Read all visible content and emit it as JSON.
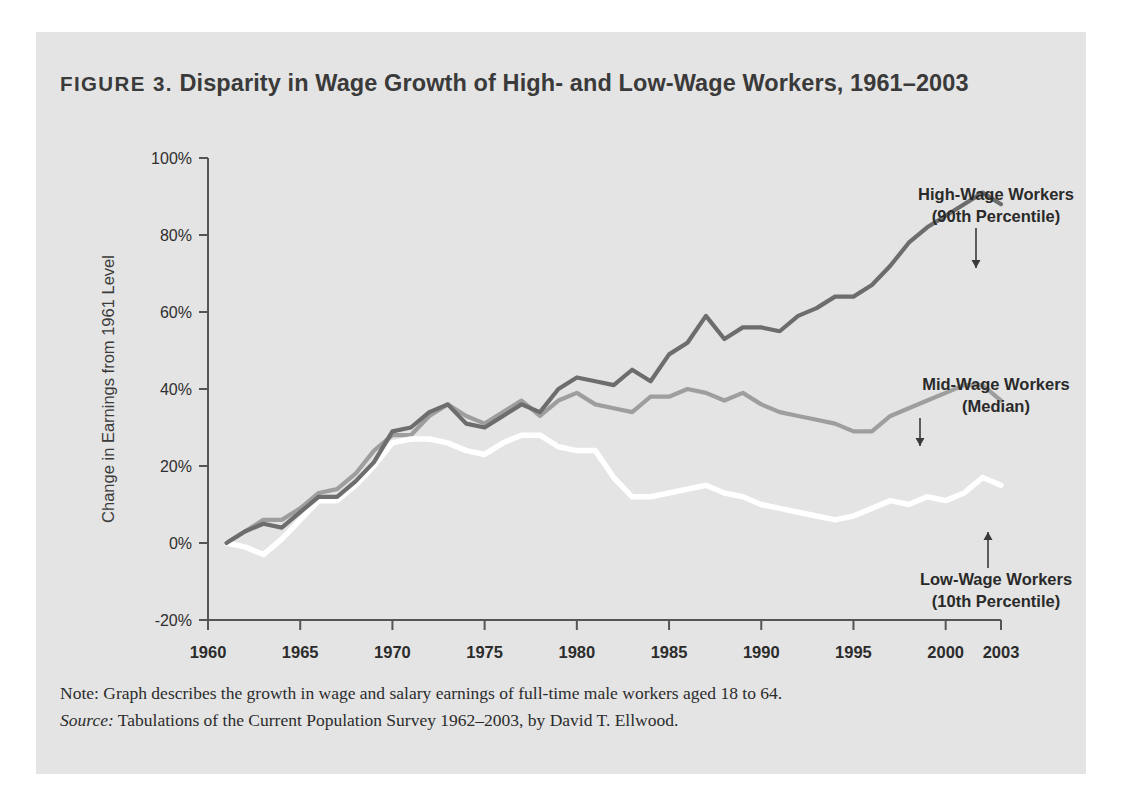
{
  "figure": {
    "label": "FIGURE 3.",
    "title": "Disparity in Wage Growth of High- and Low-Wage Workers, 1961–2003",
    "note": "Note: Graph describes the growth in wage and salary earnings of full-time male workers aged 18 to 64.",
    "source_label": "Source:",
    "source_text": " Tabulations of the Current Population Survey 1962–2003, by David T. Ellwood."
  },
  "colors": {
    "panel_background": "#e4e4e4",
    "page_background": "#ffffff",
    "axis": "#555555",
    "high_wage": "#6d6d6d",
    "mid_wage": "#9e9e9e",
    "low_wage": "#ffffff",
    "text": "#2c2c2c"
  },
  "chart_data": {
    "type": "line",
    "title": "Disparity in Wage Growth of High- and Low-Wage Workers, 1961–2003",
    "xlabel": "",
    "ylabel": "Change in Earnings from 1961 Level",
    "xlim": [
      1960,
      2003
    ],
    "ylim": [
      -20,
      100
    ],
    "ytick_labels": [
      "-20%",
      "0%",
      "20%",
      "40%",
      "60%",
      "80%",
      "100%"
    ],
    "ytick_values": [
      -20,
      0,
      20,
      40,
      60,
      80,
      100
    ],
    "xtick_labels": [
      "1960",
      "1965",
      "1970",
      "1975",
      "1980",
      "1985",
      "1990",
      "1995",
      "2000",
      "2003"
    ],
    "xtick_values": [
      1960,
      1965,
      1970,
      1975,
      1980,
      1985,
      1990,
      1995,
      2000,
      2003
    ],
    "grid": false,
    "legend_position": "inline-annotations",
    "x": [
      1961,
      1962,
      1963,
      1964,
      1965,
      1966,
      1967,
      1968,
      1969,
      1970,
      1971,
      1972,
      1973,
      1974,
      1975,
      1976,
      1977,
      1978,
      1979,
      1980,
      1981,
      1982,
      1983,
      1984,
      1985,
      1986,
      1987,
      1988,
      1989,
      1990,
      1991,
      1992,
      1993,
      1994,
      1995,
      1996,
      1997,
      1998,
      1999,
      2000,
      2001,
      2002,
      2003
    ],
    "series": [
      {
        "name": "High-Wage Workers (90th Percentile)",
        "annotation": "High-Wage Workers\n(90th Percentile)",
        "color": "#6d6d6d",
        "values": [
          0,
          3,
          5,
          4,
          8,
          12,
          12,
          16,
          21,
          29,
          30,
          34,
          36,
          31,
          30,
          33,
          36,
          34,
          40,
          43,
          42,
          41,
          45,
          42,
          49,
          52,
          59,
          53,
          56,
          56,
          55,
          59,
          61,
          64,
          64,
          67,
          72,
          78,
          82,
          85,
          88,
          91,
          88
        ]
      },
      {
        "name": "Mid-Wage Workers (Median)",
        "annotation": "Mid-Wage Workers\n(Median)",
        "color": "#9e9e9e",
        "values": [
          0,
          3,
          6,
          6,
          9,
          13,
          14,
          18,
          24,
          28,
          28,
          33,
          36,
          33,
          31,
          34,
          37,
          33,
          37,
          39,
          36,
          35,
          34,
          38,
          38,
          40,
          39,
          37,
          39,
          36,
          34,
          33,
          32,
          31,
          29,
          29,
          33,
          35,
          37,
          39,
          41,
          41,
          37
        ]
      },
      {
        "name": "Low-Wage Workers (10th Percentile)",
        "annotation": "Low-Wage Workers\n(10th Percentile)",
        "color": "#ffffff",
        "values": [
          0,
          -1,
          -3,
          1,
          6,
          11,
          11,
          15,
          20,
          26,
          27,
          27,
          26,
          24,
          23,
          26,
          28,
          28,
          25,
          24,
          24,
          17,
          12,
          12,
          13,
          14,
          15,
          13,
          12,
          10,
          9,
          8,
          7,
          6,
          7,
          9,
          11,
          10,
          12,
          11,
          13,
          17,
          15
        ]
      }
    ],
    "annotations": [
      {
        "text_line1": "High-Wage Workers",
        "text_line2": "(90th Percentile)",
        "target_year": 2000,
        "target_value": 80
      },
      {
        "text_line1": "Mid-Wage Workers",
        "text_line2": "(Median)",
        "target_year": 1997,
        "target_value": 36
      },
      {
        "text_line1": "Low-Wage Workers",
        "text_line2": "(10th Percentile)",
        "target_year": 2002,
        "target_value": 17
      }
    ]
  }
}
